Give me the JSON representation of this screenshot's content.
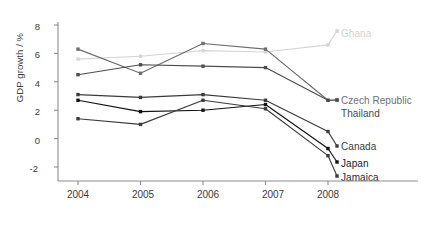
{
  "chart_data": {
    "type": "line",
    "title": "",
    "xlabel": "",
    "ylabel": "GDP growth / %",
    "categories": [
      "2004",
      "2005",
      "2006",
      "2007",
      "2008"
    ],
    "x": [
      2004,
      2005,
      2006,
      2007,
      2008
    ],
    "ylim": [
      -2,
      8
    ],
    "yticks": [
      "8",
      "6",
      "4",
      "2",
      "0",
      "-2"
    ],
    "ytick_values": [
      8,
      6,
      4,
      2,
      0,
      -2
    ],
    "xlim": [
      2003.55,
      2008.45
    ],
    "grid": false,
    "legend_position": "right-inline-labels",
    "markers": "square",
    "series": [
      {
        "name": "Ghana",
        "color": "#d5d5d7",
        "label_color": "#d2d2d5",
        "values": [
          5.6,
          5.8,
          6.2,
          6.1,
          6.6
        ]
      },
      {
        "name": "Czech Republic",
        "color": "#6d6d6f",
        "label_color": "#6f6f71",
        "values": [
          6.3,
          4.6,
          6.7,
          6.3,
          2.7
        ]
      },
      {
        "name": "Thailand",
        "color": "#4d4d4f",
        "label_color": "#4a4a4c",
        "values": [
          4.5,
          5.2,
          5.1,
          5.0,
          2.7
        ]
      },
      {
        "name": "Canada",
        "color": "#3b3b3d",
        "label_color": "#3a3a3c",
        "values": [
          3.1,
          2.9,
          3.1,
          2.7,
          0.5
        ]
      },
      {
        "name": "Japan",
        "color": "#111113",
        "label_color": "#1a1a1c",
        "values": [
          2.7,
          1.9,
          2.0,
          2.4,
          -0.7
        ]
      },
      {
        "name": "Jamaica",
        "color": "#3b3b3d",
        "label_color": "#2a2a2c",
        "values": [
          1.4,
          1.0,
          2.7,
          2.1,
          -1.2
        ]
      }
    ],
    "axis_color": "#8d8d8f",
    "label_text_color": "#3a3a3a"
  },
  "labels": {
    "ghana": "Ghana",
    "czech_republic": "Czech Republic",
    "thailand": "Thailand",
    "canada": "Canada",
    "japan": "Japan",
    "jamaica": "Jamaica"
  },
  "axis": {
    "y_title": "GDP growth / %",
    "y_t0": "8",
    "y_t1": "6",
    "y_t2": "4",
    "y_t3": "2",
    "y_t4": "0",
    "y_t5": "-2",
    "x_t0": "2004",
    "x_t1": "2005",
    "x_t2": "2006",
    "x_t3": "2007",
    "x_t4": "2008"
  }
}
